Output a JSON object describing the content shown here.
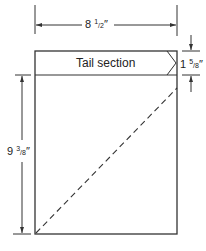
{
  "diagram": {
    "section_label": "Tail section",
    "width_dimension": {
      "whole": "8",
      "num": "1",
      "den": "2",
      "unit": "″"
    },
    "tail_height_dimension": {
      "whole": "1",
      "num": "5",
      "den": "8",
      "unit": "″"
    },
    "body_height_dimension": {
      "whole": "9",
      "num": "3",
      "den": "8",
      "unit": "″"
    },
    "line_color": "#333333",
    "fold_line_style": "dashed"
  }
}
